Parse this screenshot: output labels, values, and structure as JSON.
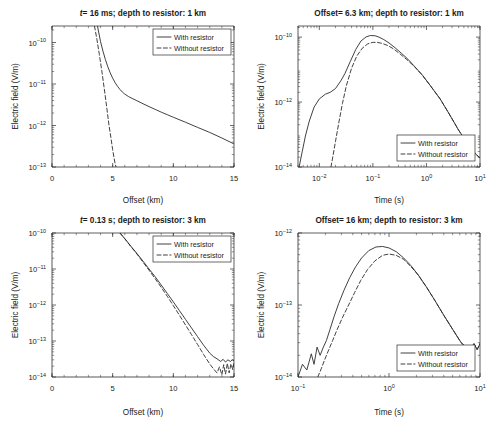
{
  "figure": {
    "background": "#ffffff",
    "line_color": "#2b2b2b",
    "legend_labels": {
      "with": "With resistor",
      "without": "Without resistor"
    }
  },
  "chart_data": [
    {
      "id": "top-left",
      "type": "line",
      "title": "t= 16 ms; depth to resistor: 1 km",
      "title_italic_prefix": "t",
      "title_rest": "= 16 ms; depth to resistor: 1 km",
      "xlabel": "Offset (km)",
      "ylabel": "Electric field (V/m)",
      "xscale": "linear",
      "yscale": "log",
      "xlim": [
        0,
        15
      ],
      "ylim": [
        1e-13,
        2.5e-10
      ],
      "xticks": [
        0,
        5,
        10,
        15
      ],
      "xticklabels": [
        "0",
        "5",
        "10",
        "15"
      ],
      "yticks": [
        1e-10,
        1e-11,
        1e-12,
        1e-13
      ],
      "yticklabels": [
        "10^-10",
        "10^-11",
        "10^-12",
        "10^-13"
      ],
      "grid": false,
      "legend_position": "upper right",
      "series": [
        {
          "name": "With resistor",
          "style": "solid",
          "x": [
            3.75,
            4.0,
            4.2,
            4.4,
            4.6,
            4.8,
            5.0,
            5.2,
            5.4,
            5.6,
            5.8,
            6.0,
            6.3,
            6.6,
            7.0,
            7.5,
            8.0,
            8.5,
            9.0,
            9.5,
            10.0,
            11.0,
            12.0,
            13.0,
            14.0,
            15.0
          ],
          "y": [
            2.5e-10,
            1.05e-10,
            6.2e-11,
            3.9e-11,
            2.6e-11,
            1.85e-11,
            1.38e-11,
            1.08e-11,
            8.8e-12,
            7.4e-12,
            6.4e-12,
            5.7e-12,
            5e-12,
            4.5e-12,
            3.95e-12,
            3.35e-12,
            2.85e-12,
            2.45e-12,
            2.1e-12,
            1.82e-12,
            1.58e-12,
            1.2e-12,
            9e-13,
            6.8e-13,
            5e-13,
            3.6e-13
          ]
        },
        {
          "name": "Without resistor",
          "style": "dashed",
          "x": [
            3.5,
            3.7,
            3.9,
            4.1,
            4.3,
            4.5,
            4.7,
            4.85,
            5.0,
            5.1,
            5.2,
            5.28
          ],
          "y": [
            2.5e-10,
            1.2e-10,
            5.2e-11,
            2.1e-11,
            8e-12,
            2.9e-12,
            1e-12,
            5.2e-13,
            2.6e-13,
            1.75e-13,
            1.2e-13,
            1e-13
          ]
        }
      ]
    },
    {
      "id": "top-right",
      "type": "line",
      "title": "Offset= 6.3 km; depth to resistor: 1 km",
      "xlabel": "Time (s)",
      "ylabel": "Electric field (V/m)",
      "xscale": "log",
      "yscale": "log",
      "xlim": [
        0.004,
        10
      ],
      "ylim": [
        1e-14,
        2.2e-10
      ],
      "xticks": [
        0.01,
        0.1,
        1,
        10
      ],
      "xticklabels": [
        "10^-2",
        "10^-1",
        "10^0",
        "10^1"
      ],
      "yticks": [
        1e-10,
        1e-12,
        1e-14
      ],
      "yticklabels": [
        "10^-10",
        "10^-12",
        "10^-14"
      ],
      "grid": false,
      "legend_position": "lower right",
      "series": [
        {
          "name": "With resistor",
          "style": "solid",
          "x": [
            0.0042,
            0.0048,
            0.0055,
            0.0065,
            0.008,
            0.01,
            0.013,
            0.016,
            0.02,
            0.025,
            0.03,
            0.038,
            0.048,
            0.06,
            0.075,
            0.09,
            0.11,
            0.13,
            0.16,
            0.2,
            0.26,
            0.34,
            0.45,
            0.6,
            0.85,
            1.2,
            1.8,
            2.6,
            4.0,
            6.0,
            8.5,
            10.0
          ],
          "y": [
            1e-14,
            3e-14,
            9e-14,
            2.6e-13,
            7e-13,
            1.25e-12,
            1.75e-12,
            2e-12,
            2.6e-12,
            4.4e-12,
            7.5e-12,
            1.8e-11,
            4.2e-11,
            7.6e-11,
            1.02e-10,
            1.12e-10,
            1.1e-10,
            1e-10,
            8.4e-11,
            6.6e-11,
            4.7e-11,
            3.2e-11,
            2.1e-11,
            1.25e-11,
            6.6e-12,
            3.1e-12,
            1.25e-12,
            4.6e-13,
            1.35e-13,
            5e-14,
            2.4e-14,
            1.9e-14
          ]
        },
        {
          "name": "Without resistor",
          "style": "dashed",
          "x": [
            0.0165,
            0.018,
            0.02,
            0.023,
            0.027,
            0.032,
            0.04,
            0.05,
            0.063,
            0.08,
            0.1,
            0.12,
            0.15,
            0.19,
            0.24,
            0.31,
            0.42,
            0.58,
            0.82,
            1.2,
            1.8,
            2.6,
            4.0,
            6.0,
            8.5,
            10.0
          ],
          "y": [
            1e-14,
            2.2e-14,
            6e-14,
            2.2e-13,
            9e-13,
            3.2e-12,
            1.1e-11,
            2.6e-11,
            4.5e-11,
            6.2e-11,
            6.9e-11,
            6.9e-11,
            6.4e-11,
            5.5e-11,
            4.4e-11,
            3.2e-11,
            2.1e-11,
            1.3e-11,
            7e-12,
            3.1e-12,
            1.25e-12,
            4.6e-13,
            1.35e-13,
            5e-14,
            2.4e-14,
            1.9e-14
          ]
        }
      ]
    },
    {
      "id": "bottom-left",
      "type": "line",
      "title": "t= 0.13 s; depth to resistor: 3 km",
      "title_italic_prefix": "t",
      "title_rest": "= 0.13 s; depth to resistor: 3 km",
      "xlabel": "Offset (km)",
      "ylabel": "Electric field (V/m)",
      "xscale": "linear",
      "yscale": "log",
      "xlim": [
        0,
        15
      ],
      "ylim": [
        1e-14,
        1e-10
      ],
      "xticks": [
        0,
        5,
        10,
        15
      ],
      "xticklabels": [
        "0",
        "5",
        "10",
        "15"
      ],
      "yticks": [
        1e-10,
        1e-11,
        1e-12,
        1e-13,
        1e-14
      ],
      "yticklabels": [
        "10^-10",
        "10^-11",
        "10^-12",
        "10^-13",
        "10^-14"
      ],
      "grid": false,
      "legend_position": "upper right",
      "series": [
        {
          "name": "With resistor",
          "style": "solid",
          "x": [
            5.6,
            6.0,
            6.5,
            7.0,
            7.5,
            8.0,
            8.5,
            9.0,
            9.5,
            10.0,
            10.5,
            11.0,
            11.5,
            12.0,
            12.5,
            13.0,
            13.3,
            13.6,
            13.9,
            14.1,
            14.3,
            14.5,
            14.7,
            14.85,
            15.0
          ],
          "y": [
            1e-10,
            7e-11,
            4.3e-11,
            2.7e-11,
            1.65e-11,
            1e-11,
            6.1e-12,
            3.6e-12,
            2.1e-12,
            1.22e-12,
            7e-13,
            4e-13,
            2.3e-13,
            1.32e-13,
            7.6e-14,
            4.6e-14,
            3.7e-14,
            3.2e-14,
            2.7e-14,
            3.1e-14,
            2.6e-14,
            3e-14,
            2.7e-14,
            3e-14,
            2.8e-14
          ]
        },
        {
          "name": "Without resistor",
          "style": "dashed",
          "x": [
            5.6,
            6.0,
            6.5,
            7.0,
            7.5,
            8.0,
            8.5,
            9.0,
            9.5,
            10.0,
            10.5,
            11.0,
            11.5,
            12.0,
            12.5,
            13.0,
            13.3,
            13.6,
            13.8,
            14.0,
            14.15,
            14.3,
            14.45,
            14.6,
            14.75,
            14.9,
            15.0
          ],
          "y": [
            1e-10,
            6.9e-11,
            4.2e-11,
            2.6e-11,
            1.55e-11,
            9.2e-12,
            5.4e-12,
            3.1e-12,
            1.75e-12,
            9.6e-13,
            5.2e-13,
            2.8e-13,
            1.5e-13,
            8e-14,
            4.2e-14,
            2.3e-14,
            1.7e-14,
            1.3e-14,
            1.9e-14,
            1.15e-14,
            2.2e-14,
            1.2e-14,
            2.4e-14,
            1.3e-14,
            2.3e-14,
            1.6e-14,
            2.5e-14
          ]
        }
      ]
    },
    {
      "id": "bottom-right",
      "type": "line",
      "title": "Offset= 16 km; depth to resistor: 3 km",
      "xlabel": "Time (s)",
      "ylabel": "Electric field (V/m)",
      "xscale": "log",
      "yscale": "log",
      "xlim": [
        0.1,
        10
      ],
      "ylim": [
        1e-14,
        1e-12
      ],
      "xticks": [
        0.1,
        1,
        10
      ],
      "xticklabels": [
        "10^-1",
        "10^0",
        "10^1"
      ],
      "yticks": [
        1e-12,
        1e-13,
        1e-14
      ],
      "yticklabels": [
        "10^-12",
        "10^-13",
        "10^-14"
      ],
      "grid": false,
      "legend_position": "lower right",
      "series": [
        {
          "name": "With resistor",
          "style": "solid",
          "x": [
            0.1,
            0.112,
            0.125,
            0.14,
            0.15,
            0.162,
            0.175,
            0.19,
            0.205,
            0.225,
            0.25,
            0.28,
            0.32,
            0.37,
            0.43,
            0.5,
            0.6,
            0.72,
            0.85,
            1.0,
            1.2,
            1.45,
            1.75,
            2.1,
            2.6,
            3.2,
            4.0,
            5.0,
            6.2,
            7.5,
            8.6,
            9.3,
            10.0
          ],
          "y": [
            1e-14,
            1.5e-14,
            1.25e-14,
            2.1e-14,
            1.5e-14,
            2.6e-14,
            2e-14,
            2.6e-14,
            3.2e-14,
            4.6e-14,
            7e-14,
            1.05e-13,
            1.6e-13,
            2.4e-13,
            3.4e-13,
            4.5e-13,
            5.7e-13,
            6.4e-13,
            6.5e-13,
            6.2e-13,
            5.5e-13,
            4.5e-13,
            3.5e-13,
            2.6e-13,
            1.75e-13,
            1.15e-13,
            7.2e-14,
            4.6e-14,
            3e-14,
            2.4e-14,
            2.9e-14,
            2.4e-14,
            2.9e-14
          ]
        },
        {
          "name": "Without resistor",
          "style": "dashed",
          "x": [
            0.165,
            0.18,
            0.195,
            0.215,
            0.24,
            0.27,
            0.31,
            0.36,
            0.42,
            0.49,
            0.58,
            0.7,
            0.85,
            1.0,
            1.2,
            1.45,
            1.75,
            2.1,
            2.6,
            3.2,
            4.0,
            5.0,
            6.2,
            7.5,
            8.6,
            9.3,
            10.0
          ],
          "y": [
            1e-14,
            1.3e-14,
            1.7e-14,
            2.3e-14,
            3.2e-14,
            4.6e-14,
            6.8e-14,
            1e-13,
            1.5e-13,
            2.2e-13,
            3.1e-13,
            4.1e-13,
            4.9e-13,
            5.1e-13,
            4.9e-13,
            4.3e-13,
            3.4e-13,
            2.6e-13,
            1.75e-13,
            1.15e-13,
            7.2e-14,
            4.6e-14,
            3e-14,
            2.4e-14,
            2.9e-14,
            2.4e-14,
            2.9e-14
          ]
        }
      ]
    }
  ]
}
